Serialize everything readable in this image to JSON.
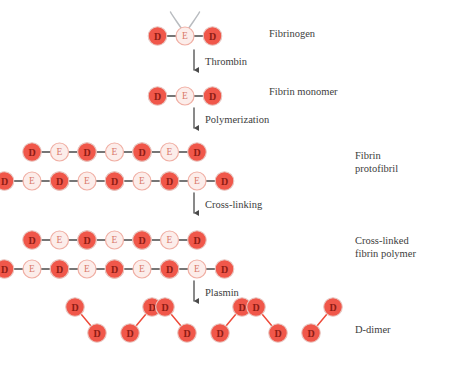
{
  "diagram": {
    "colors": {
      "d_node_fill": "#F0574A",
      "d_node_edge": "#E8C9C4",
      "d_node_text": "#8E1C14",
      "e_node_fill": "#FCEDEA",
      "e_node_edge": "#F0AFA4",
      "e_node_text": "#D9796B",
      "bond": "#4A4A4A",
      "contact_dotted": "#F4A79A",
      "crosslink": "#EE4B3A",
      "whisker": "#B9BCC0",
      "arrow": "#4A4A4A",
      "background": "#FFFFFF"
    },
    "node_labels": {
      "d": "D",
      "e": "E"
    },
    "stages": [
      {
        "id": "fibrinogen",
        "label": "Fibrinogen",
        "structure": "D-E-D monomer with two alpha/beta peptide whiskers on E",
        "units": 1,
        "rows": 1,
        "has_whiskers": true
      },
      {
        "id": "fibrin-monomer",
        "label": "Fibrin monomer",
        "structure": "D-E-D monomer, fibrinopeptides cleaved",
        "units": 1,
        "rows": 1,
        "has_whiskers": false
      },
      {
        "id": "fibrin-protofibril",
        "label": "Fibrin\nprotofibril",
        "structure": "Two staggered half-overlapping rows of D-E-D units joined by non-covalent dotted D:D contacts",
        "units_top": 3,
        "units_bottom": 4,
        "rows": 2,
        "crosslinked": false
      },
      {
        "id": "cross-linked-fibrin-polymer",
        "label": "Cross-linked\nfibrin polymer",
        "structure": "Protofibril with covalent factor XIIIa gamma-gamma cross-links between adjacent D domains",
        "units_top": 3,
        "units_bottom": 4,
        "rows": 2,
        "crosslinked": true
      },
      {
        "id": "d-dimer",
        "label": "D-dimer",
        "structure": "Pairs of covalently linked D domains released by plasmin digestion",
        "fragments": 6
      }
    ],
    "arrows": [
      {
        "id": "thrombin",
        "label": "Thrombin"
      },
      {
        "id": "polymerization",
        "label": "Polymerization"
      },
      {
        "id": "cross-linking",
        "label": "Cross-linking"
      },
      {
        "id": "plasmin",
        "label": "Plasmin"
      }
    ]
  }
}
